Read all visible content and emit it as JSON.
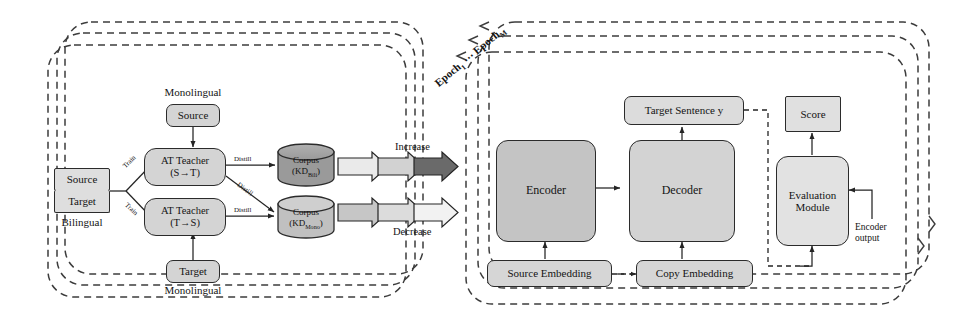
{
  "figure": {
    "type": "architecture-diagram"
  },
  "left_panel": {
    "name": "Data construction / teacher distillation stage",
    "stacked_frames": 3,
    "nodes": {
      "monolingual_source": {
        "label": "Source",
        "caption": "Monolingual"
      },
      "monolingual_target": {
        "label": "Target",
        "caption": "Monolingual"
      },
      "bilingual_source": {
        "label": "Source"
      },
      "bilingual_target": {
        "label": "Target"
      },
      "bilingual_caption": "Bilingual",
      "teacher_st": {
        "line1": "AT  Teacher",
        "line2": "(S→T)"
      },
      "teacher_ts": {
        "line1": "AT  Teacher",
        "line2": "(T→S)"
      },
      "corpus_bili": {
        "line1": "Corpus",
        "line2_prefix": "(KD",
        "line2_sub": "Bili",
        "line2_suffix": ")"
      },
      "corpus_mono": {
        "line1": "Corpus",
        "line2_prefix": "(KD",
        "line2_sub": "Mono",
        "line2_suffix": ")"
      }
    },
    "edge_labels": {
      "train_top": "Train",
      "train_bottom": "Train",
      "distill_top": "Distill",
      "distill_cross": "Distill",
      "distill_bottom": "Distill"
    }
  },
  "flow": {
    "increase": {
      "label": "Increase",
      "arrow_tip_color": "#6a6a6a"
    },
    "decrease": {
      "label": "Decrease",
      "arrow_tip_color": "#ebebeb"
    }
  },
  "right_panel": {
    "name": "NAT student training stage",
    "stacked_frames": 3,
    "epoch_label_first": "Epoch",
    "epoch_label_first_sub": "1",
    "epoch_label_ellipsis": "⋯",
    "epoch_label_last": "Epoch",
    "epoch_label_last_sub": "M",
    "nodes": {
      "encoder": {
        "label": "Encoder"
      },
      "decoder": {
        "label": "Decoder"
      },
      "target_sentence": {
        "label": "Target Sentence y"
      },
      "score": {
        "label": "Score"
      },
      "evaluation_module": {
        "line1": "Evaluation",
        "line2": "Module"
      },
      "source_embedding": {
        "label": "Source Embedding"
      },
      "copy_embedding": {
        "label": "Copy Embedding"
      }
    },
    "edge_labels": {
      "encoder_output": {
        "line1": "Encoder",
        "line2": "output"
      }
    }
  },
  "colors": {
    "node_fill": "#d4d4d4",
    "node_fill_light": "#dedede",
    "encoder_fill": "#c4c4c4",
    "decoder_fill": "#d3d3d3",
    "eval_fill": "#e2e2e2",
    "corpus_fill_dark": "#9a9a9a",
    "corpus_fill_light": "#c0c0c0",
    "stroke": "#2b2b2b",
    "dashed_stroke": "#3c3c3c",
    "arrow_fill_light": "#eaeaea",
    "arrow_fill_mid": "#c8c8c8",
    "arrow_fill_dark": "#6a6a6a"
  }
}
